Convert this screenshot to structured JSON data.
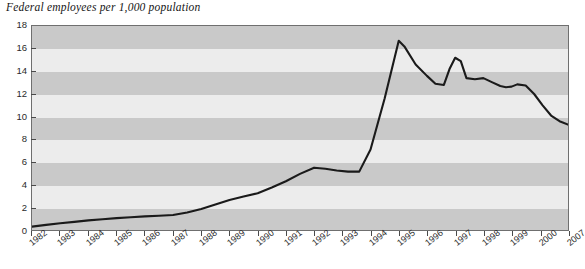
{
  "chart_data": {
    "type": "line",
    "title": "Federal employees per 1,000 population",
    "xlabel": "",
    "ylabel": "",
    "ylim": [
      0,
      18
    ],
    "ytick_step": 2,
    "yticks": [
      "18",
      "16",
      "14",
      "12",
      "10",
      "8",
      "6",
      "4",
      "2",
      "0"
    ],
    "grid": "horizontal-alternating-bands",
    "legend": "none",
    "categories": [
      "1982",
      "1983",
      "1984",
      "1985",
      "1986",
      "1987",
      "1988",
      "1989",
      "1990",
      "1991",
      "1992",
      "1993",
      "1994",
      "1995",
      "1996",
      "1997",
      "1998",
      "1999",
      "2000",
      "2007"
    ],
    "series": [
      {
        "name": "Federal employees per 1,000 population",
        "color": "#1a1a1a",
        "x": [
          1982.0,
          1982.5,
          1983.0,
          1983.5,
          1984.0,
          1984.5,
          1985.0,
          1985.5,
          1986.0,
          1986.5,
          1987.0,
          1987.5,
          1988.0,
          1988.5,
          1989.0,
          1989.5,
          1990.0,
          1990.5,
          1991.0,
          1991.5,
          1992.0,
          1992.4,
          1992.8,
          1993.2,
          1993.6,
          1994.0,
          1994.5,
          1995.0,
          1995.2,
          1995.6,
          1996.0,
          1996.3,
          1996.6,
          1996.8,
          1997.0,
          1997.2,
          1997.4,
          1997.7,
          1998.0,
          1998.3,
          1998.6,
          1998.8,
          1999.0,
          1999.2,
          1999.5,
          1999.8,
          2000.1,
          2000.4,
          2000.7,
          2001.0
        ],
        "values": [
          0.3,
          0.45,
          0.6,
          0.72,
          0.85,
          0.95,
          1.05,
          1.12,
          1.2,
          1.26,
          1.32,
          1.55,
          1.85,
          2.25,
          2.65,
          2.95,
          3.25,
          3.75,
          4.3,
          4.95,
          5.5,
          5.4,
          5.25,
          5.15,
          5.15,
          7.1,
          11.6,
          16.7,
          16.2,
          14.6,
          13.6,
          12.9,
          12.8,
          14.2,
          15.2,
          14.9,
          13.4,
          13.3,
          13.4,
          13.05,
          12.7,
          12.6,
          12.65,
          12.85,
          12.75,
          12.0,
          11.0,
          10.1,
          9.6,
          9.3
        ]
      }
    ],
    "annotations": {
      "peak_year": "1995",
      "peak_value": 16.7,
      "end_value": 9.3,
      "start_value": 0.3
    },
    "colors": {
      "line": "#1a1a1a",
      "band_light": "#ececec",
      "band_dark": "#c9c9c9",
      "frame": "#6f6f6f",
      "tick": "#4a4a4a",
      "text": "#2a2a2a",
      "background": "#ffffff"
    }
  }
}
